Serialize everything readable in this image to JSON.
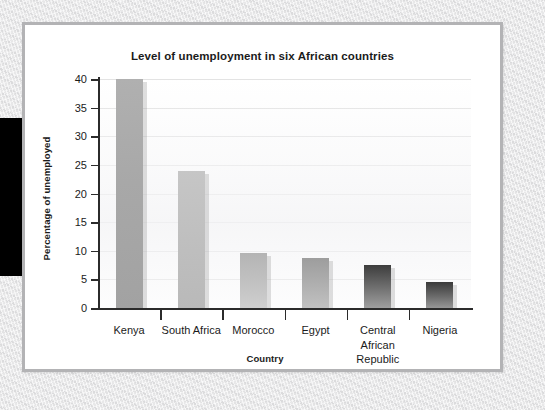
{
  "chart_data": {
    "type": "bar",
    "title": "Level of unemployment in six African countries",
    "xlabel": "Country",
    "ylabel": "Percentage of unemployed",
    "categories": [
      "Kenya",
      "South Africa",
      "Morocco",
      "Egypt",
      "Central African Republic",
      "Nigeria"
    ],
    "values": [
      40,
      24,
      9.6,
      8.7,
      7.6,
      4.5
    ],
    "ylim": [
      0,
      40
    ],
    "ytick_step": 5,
    "yticks": [
      "40",
      "35",
      "30",
      "25",
      "20",
      "15",
      "10",
      "5",
      "0"
    ],
    "ytick_values": [
      40,
      35,
      30,
      25,
      20,
      15,
      10,
      5,
      0
    ],
    "grid": true,
    "grid_axis": "y",
    "legend": "none",
    "series": [
      {
        "name": "Percentage of unemployed",
        "values": [
          40,
          24,
          9.6,
          8.7,
          7.6,
          4.5
        ]
      }
    ],
    "bar_fills": [
      "linear-gradient(180deg,#b0b0b0 0%,#a8a8a8 45%,#a2a2a2 100%)",
      "linear-gradient(180deg,#c6c6c6 0%,#bfbfbf 50%,#b9b9b9 100%)",
      "linear-gradient(180deg,#b4b4b4 0%,#c2c2c2 55%,#cfcfcf 100%)",
      "linear-gradient(180deg,#9d9d9d 0%,#b0b0b0 55%,#c1c1c1 100%)",
      "linear-gradient(180deg,#3d3d3d 0%,#6d6d6d 50%,#9f9f9f 100%)",
      "linear-gradient(180deg,#3a3a3a 0%,#666666 50%,#979797 100%)"
    ]
  },
  "theme": {
    "card_background": "#ffffff",
    "card_border": "#b3b3b5",
    "axis_color": "#2b2b2b",
    "gridline_color": "#e3e3e3",
    "text_color": "#1b1b1b",
    "backdrop": "#eaeaec",
    "margin_block": "#000000"
  }
}
